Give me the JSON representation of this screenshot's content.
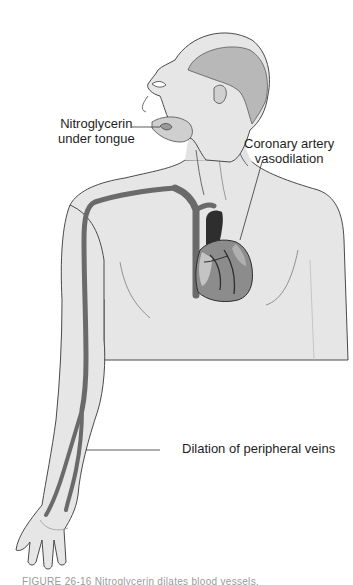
{
  "figure": {
    "labels": {
      "sublingual": {
        "line1": "Nitroglycerin",
        "line2": "under tongue"
      },
      "coronary": {
        "line1": "Coronary artery",
        "line2": "vasodilation"
      },
      "peripheral": {
        "text": "Dilation of peripheral veins"
      }
    },
    "caption": "FIGURE 26-16 Nitroglycerin dilates blood vessels.",
    "colors": {
      "skin": "#e6e6e6",
      "skin_shadow": "#cfcfcf",
      "outline": "#4a4a4a",
      "vessel": "#6a6a6a",
      "heart_dark": "#2e2e2e",
      "heart_mid": "#8c8c8c",
      "heart_light": "#c4c4c4",
      "label_text": "#1e1e1e",
      "leader_line": "#333333"
    }
  }
}
